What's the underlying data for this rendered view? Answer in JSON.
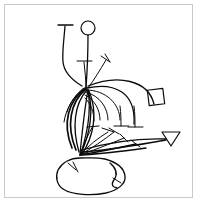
{
  "figure": {
    "canvas": {
      "width": 199,
      "height": 206
    },
    "colors": {
      "background": "#ffffff",
      "ink": "#0b0b0b",
      "frame": "#c9c9c9"
    },
    "frame": {
      "x": 4,
      "y": 4,
      "width": 189,
      "height": 194,
      "stroke": "#c9c9c9",
      "stroke_width": 1
    },
    "nodes": [
      {
        "name": "upper-node",
        "x": 88,
        "y": 88
      },
      {
        "name": "lower-node",
        "x": 80,
        "y": 156
      }
    ],
    "glyphs": {
      "circle": {
        "cx": 88,
        "cy": 28,
        "r": 7
      },
      "diamond": {
        "cx": 156,
        "cy": 97,
        "half": 11,
        "rotation_deg": 38
      },
      "arrowhead": {
        "cx": 171,
        "cy": 139,
        "size": 9
      }
    },
    "paths": {
      "left_long_stem": "M 65,26 C 64,40 62,52 63,62 C 64,72 72,80 82,86",
      "left_top_tbar": "M 58,25 L 73,25",
      "circle_stem": "M 88,35 C 88,58 87,74 86,88",
      "inner_tbar_stem": "M 84,62 C 85,72 86,80 86,88",
      "inner_tbar_cap": "M 77,61 L 92,61",
      "chevron_stem": "M 106,60 C 100,70 94,80 88,88",
      "chevron_cap_a": "M 101,56 L 110,62",
      "chevron_cap_b": "M 110,62 L 105,54",
      "arc_outer": "M 88,86 C 118,74 148,80 154,104",
      "arc_second": "M 87,88 C 114,82 136,92 134,124",
      "arc_third": "M 86,90 C 106,90 120,104 120,120",
      "arc_fourth": "M 86,92 C 100,96 108,108 108,120",
      "arc_fifth": "M 85,95 C 95,100 100,110 100,120",
      "arc_inner": "M 85,98 C 91,104 94,112 94,121",
      "long_sweep_low": "M 82,150 C 110,142 140,138 166,139",
      "long_sweep_mid": "M 82,152 C 112,150 142,144 166,140",
      "bowl_left_outer": "M 86,88 C 68,100 62,124 72,148",
      "bowl_left_mid": "M 86,89 C 70,102 66,126 76,150",
      "bowl_left_inner": "M 87,90 C 74,104 72,128 79,152",
      "bowl_right_inner": "M 88,90 C 94,110 90,134 81,153",
      "bowl_right_mid": "M 89,91 C 98,112 94,136 82,154",
      "spoke_a": "M 88,90 C 84,112 82,134 80,154",
      "spoke_b": "M 88,90 C 92,114 86,136 81,154",
      "spoke_lower_1": "M 80,155 C 92,148 104,140 114,132",
      "spoke_lower_2": "M 80,155 C 94,150 110,144 124,138",
      "spoke_lower_3": "M 80,155 C 98,152 118,148 136,144",
      "spoke_lower_4": "M 80,155 C 100,154 124,151 146,148",
      "tick_lower_1_cap": "M 109,128 L 119,134",
      "tick_lower_2_cap": "M 120,134 L 128,142",
      "tick_lower_3_cap": "M 131,140 L 140,147",
      "tick_up_from_low_a": "M 80,155 C 84,144 88,134 93,126",
      "tick_up_from_low_a_cap": "M 87,127 L 99,126",
      "tick_up_from_low_b": "M 80,155 C 88,146 98,138 108,132",
      "tick_up_from_low_b_cap": "M 102,128 L 114,132",
      "tbar_mid_stem": "M 120,106 C 121,114 121,120 121,126",
      "tbar_mid_cap": "M 114,126 L 129,126",
      "tbar_right_stem": "M 134,106 C 135,114 135,120 135,127",
      "tbar_right_cap": "M 128,127 L 143,127",
      "blob_outline": "M 80,158 C 70,158 62,163 58,170 C 55,177 57,185 63,189 C 72,195 92,196 106,193 C 118,190 126,184 125,176 C 124,168 116,162 105,159 C 96,157 88,158 80,158 Z",
      "blob_tick_left": "M 68,163 L 76,170",
      "blob_tick_left_cap": "M 73,162 L 78,172",
      "blob_hook_right": "M 110,163 C 116,168 118,174 114,180 C 111,184 112,187 117,188",
      "blob_hook_cap": "M 113,178 L 121,183",
      "short_radial_left": "M 84,88 C 76,94 70,102 67,112",
      "short_radial_left2": "M 84,88 C 74,96 66,108 64,122"
    }
  }
}
